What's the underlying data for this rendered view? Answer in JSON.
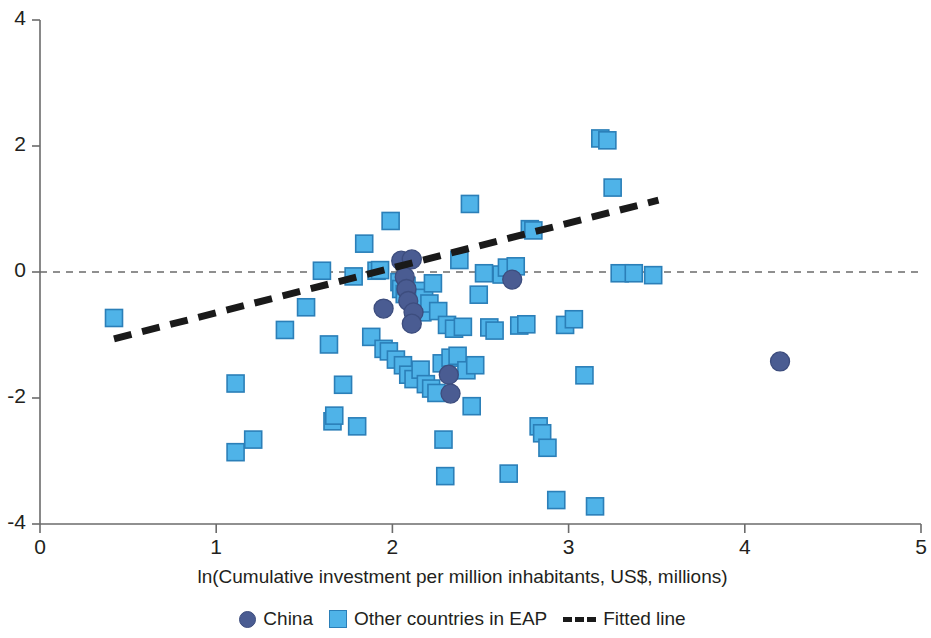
{
  "chart_data": {
    "type": "scatter",
    "title": "",
    "xlabel": "ln(Cumulative investment per million inhabitants, US$, millions)",
    "ylabel": "",
    "xlim": [
      0,
      5
    ],
    "ylim": [
      -4,
      4
    ],
    "xticks": [
      "0",
      "1",
      "2",
      "3",
      "4",
      "5"
    ],
    "xtick_values": [
      0,
      1,
      2,
      3,
      4,
      5
    ],
    "yticks": [
      "4",
      "2",
      "0",
      "-2",
      "-4"
    ],
    "ytick_values": [
      4,
      2,
      0,
      -2,
      -4
    ],
    "grid": false,
    "zero_reference_line": {
      "y": 0,
      "style": "dashed",
      "color": "#6b6b6b"
    },
    "legend": {
      "position": "bottom-center",
      "entries": [
        {
          "label": "China",
          "marker": "circle",
          "color": "#4a5c92"
        },
        {
          "label": "Other countries in EAP",
          "marker": "square",
          "color": "#4fb3e8"
        },
        {
          "label": "Fitted line",
          "marker": "dashed-line",
          "color": "#1a1a1a"
        }
      ]
    },
    "fitted_line": {
      "name": "Fitted line",
      "color": "#1a1a1a",
      "style": "dashed",
      "x_start": 0.42,
      "y_start": -1.06,
      "x_end": 3.51,
      "y_end": 1.14
    },
    "series": [
      {
        "name": "Other countries in EAP",
        "marker": "square",
        "color": "#4fb3e8",
        "edge_color": "#2b7fb8",
        "points": [
          [
            0.42,
            -0.73
          ],
          [
            1.11,
            -2.86
          ],
          [
            1.11,
            -1.77
          ],
          [
            1.21,
            -2.66
          ],
          [
            1.39,
            -0.92
          ],
          [
            1.51,
            -0.56
          ],
          [
            1.6,
            0.02
          ],
          [
            1.64,
            -1.15
          ],
          [
            1.66,
            -2.37
          ],
          [
            1.67,
            -2.28
          ],
          [
            1.72,
            -1.79
          ],
          [
            1.78,
            -0.07
          ],
          [
            1.8,
            -2.45
          ],
          [
            1.84,
            0.45
          ],
          [
            1.88,
            -1.03
          ],
          [
            1.91,
            0.02
          ],
          [
            1.93,
            0.03
          ],
          [
            1.95,
            -1.22
          ],
          [
            1.98,
            -1.26
          ],
          [
            1.99,
            0.81
          ],
          [
            2.02,
            -1.39
          ],
          [
            2.04,
            -0.16
          ],
          [
            2.05,
            -0.27
          ],
          [
            2.06,
            -1.48
          ],
          [
            2.07,
            -0.35
          ],
          [
            2.08,
            -0.22
          ],
          [
            2.09,
            -1.63
          ],
          [
            2.1,
            -0.41
          ],
          [
            2.12,
            -1.7
          ],
          [
            2.13,
            -0.52
          ],
          [
            2.14,
            -0.3
          ],
          [
            2.16,
            -1.55
          ],
          [
            2.17,
            -0.64
          ],
          [
            2.18,
            -0.41
          ],
          [
            2.19,
            -1.78
          ],
          [
            2.21,
            -0.5
          ],
          [
            2.22,
            -1.85
          ],
          [
            2.23,
            -0.18
          ],
          [
            2.25,
            -1.92
          ],
          [
            2.26,
            -0.62
          ],
          [
            2.28,
            -1.45
          ],
          [
            2.29,
            -2.66
          ],
          [
            2.3,
            -3.24
          ],
          [
            2.31,
            -0.84
          ],
          [
            2.33,
            -1.36
          ],
          [
            2.35,
            -0.9
          ],
          [
            2.37,
            -1.33
          ],
          [
            2.38,
            0.19
          ],
          [
            2.4,
            -0.87
          ],
          [
            2.42,
            -1.56
          ],
          [
            2.44,
            1.08
          ],
          [
            2.45,
            -2.13
          ],
          [
            2.47,
            -1.48
          ],
          [
            2.49,
            -0.36
          ],
          [
            2.52,
            -0.02
          ],
          [
            2.55,
            -0.88
          ],
          [
            2.58,
            -0.93
          ],
          [
            2.62,
            -0.04
          ],
          [
            2.65,
            0.07
          ],
          [
            2.66,
            -3.2
          ],
          [
            2.7,
            0.09
          ],
          [
            2.72,
            -0.85
          ],
          [
            2.76,
            -0.83
          ],
          [
            2.78,
            0.68
          ],
          [
            2.8,
            0.66
          ],
          [
            2.83,
            -2.45
          ],
          [
            2.85,
            -2.56
          ],
          [
            2.88,
            -2.79
          ],
          [
            2.93,
            -3.62
          ],
          [
            2.98,
            -0.84
          ],
          [
            3.03,
            -0.75
          ],
          [
            3.09,
            -1.64
          ],
          [
            3.15,
            -3.72
          ],
          [
            3.18,
            2.12
          ],
          [
            3.22,
            2.09
          ],
          [
            3.25,
            1.34
          ],
          [
            3.29,
            -0.02
          ],
          [
            3.37,
            -0.02
          ],
          [
            3.48,
            -0.05
          ]
        ]
      },
      {
        "name": "China",
        "marker": "circle",
        "color": "#4a5c92",
        "edge_color": "#3d4d7e",
        "points": [
          [
            2.05,
            0.18
          ],
          [
            2.11,
            0.2
          ],
          [
            2.07,
            -0.08
          ],
          [
            2.08,
            -0.27
          ],
          [
            2.09,
            -0.46
          ],
          [
            1.95,
            -0.58
          ],
          [
            2.12,
            -0.64
          ],
          [
            2.11,
            -0.82
          ],
          [
            2.32,
            -1.63
          ],
          [
            2.33,
            -1.93
          ],
          [
            2.68,
            -0.12
          ],
          [
            4.2,
            -1.42
          ]
        ]
      }
    ]
  }
}
